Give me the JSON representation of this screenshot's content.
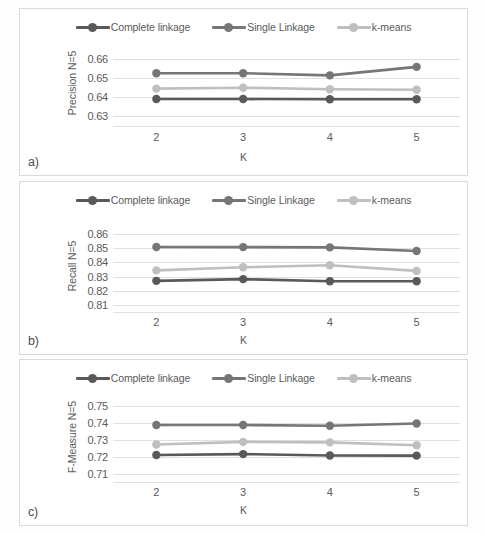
{
  "figure": {
    "background": "#ffffff",
    "panel_border_color": "#d9d9d9",
    "gridline_color": "#dfe0e1",
    "text_color": "#5a5b5d"
  },
  "series_colors": {
    "complete_linkage": "#595959",
    "single_linkage": "#767676",
    "k_means": "#bfbfbf"
  },
  "legend": {
    "items": [
      {
        "label": "Complete linkage",
        "color_key": "complete_linkage",
        "marker": "circle-line"
      },
      {
        "label": "Single Linkage",
        "color_key": "single_linkage",
        "marker": "circle-line"
      },
      {
        "label": "k-means",
        "color_key": "k_means",
        "marker": "circle-line"
      }
    ]
  },
  "panels": [
    {
      "tag": "a)",
      "chart_index": 0
    },
    {
      "tag": "b)",
      "chart_index": 1
    },
    {
      "tag": "c)",
      "chart_index": 2
    }
  ],
  "chart_data": [
    {
      "type": "line",
      "title": "",
      "xlabel": "K",
      "ylabel": "Precision N=5",
      "x": [
        2,
        3,
        4,
        5
      ],
      "categories": [
        "2",
        "3",
        "4",
        "5"
      ],
      "yticks": [
        0.66,
        0.65,
        0.64,
        0.63
      ],
      "ytick_labels": [
        "0.66",
        "0.65",
        "0.64",
        "0.63"
      ],
      "ylim": [
        0.625,
        0.665
      ],
      "grid": true,
      "legend_position": "top-center",
      "series": [
        {
          "name": "Complete linkage",
          "color_key": "complete_linkage",
          "values": [
            0.639,
            0.639,
            0.6389,
            0.6389
          ]
        },
        {
          "name": "Single Linkage",
          "color_key": "single_linkage",
          "values": [
            0.6524,
            0.6524,
            0.6513,
            0.6557
          ]
        },
        {
          "name": "k-means",
          "color_key": "k_means",
          "values": [
            0.6444,
            0.6449,
            0.6441,
            0.6438
          ]
        }
      ]
    },
    {
      "type": "line",
      "title": "",
      "xlabel": "K",
      "ylabel": "Recall N=5",
      "x": [
        2,
        3,
        4,
        5
      ],
      "categories": [
        "2",
        "3",
        "4",
        "5"
      ],
      "yticks": [
        0.86,
        0.85,
        0.84,
        0.83,
        0.82,
        0.81
      ],
      "ytick_labels": [
        "0.86",
        "0.85",
        "0.84",
        "0.83",
        "0.82",
        "0.81"
      ],
      "ylim": [
        0.805,
        0.865
      ],
      "grid": true,
      "legend_position": "top-center",
      "series": [
        {
          "name": "Complete linkage",
          "color_key": "complete_linkage",
          "values": [
            0.827,
            0.8282,
            0.8267,
            0.8267
          ]
        },
        {
          "name": "Single Linkage",
          "color_key": "single_linkage",
          "values": [
            0.8509,
            0.8508,
            0.8506,
            0.8481
          ]
        },
        {
          "name": "k-means",
          "color_key": "k_means",
          "values": [
            0.8344,
            0.8366,
            0.838,
            0.834
          ]
        }
      ]
    },
    {
      "type": "line",
      "title": "",
      "xlabel": "K",
      "ylabel": "F-Measure  N=5",
      "x": [
        2,
        3,
        4,
        5
      ],
      "categories": [
        "2",
        "3",
        "4",
        "5"
      ],
      "yticks": [
        0.75,
        0.74,
        0.73,
        0.72,
        0.71
      ],
      "ytick_labels": [
        "0.75",
        "0.74",
        "0.73",
        "0.72",
        "0.71"
      ],
      "ylim": [
        0.705,
        0.755
      ],
      "grid": true,
      "legend_position": "top-center",
      "series": [
        {
          "name": "Complete linkage",
          "color_key": "complete_linkage",
          "values": [
            0.7209,
            0.7214,
            0.7206,
            0.7205
          ]
        },
        {
          "name": "Single Linkage",
          "color_key": "single_linkage",
          "values": [
            0.7385,
            0.7385,
            0.7381,
            0.7394
          ]
        },
        {
          "name": "k-means",
          "color_key": "k_means",
          "values": [
            0.7271,
            0.7286,
            0.7283,
            0.7266
          ]
        }
      ]
    }
  ]
}
